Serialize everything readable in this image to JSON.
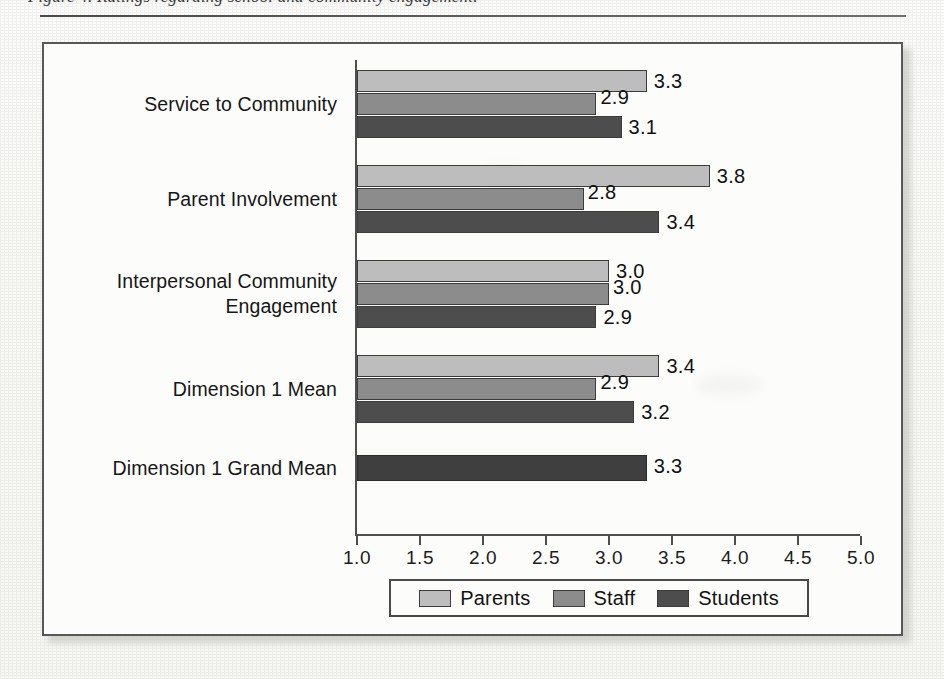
{
  "page": {
    "caption_partial": "Figure 4. Ratings regarding school and community engagement.",
    "background_color": "#fdfdfb"
  },
  "colors": {
    "parents": "#bdbdbd",
    "staff": "#8c8c8c",
    "students": "#4d4d4d",
    "grand_mean": "#3f3f3f",
    "axis": "#4f4f4f",
    "frame": "#585858",
    "text": "#111111"
  },
  "legend": {
    "position": "bottom-center",
    "items": [
      {
        "label": "Parents",
        "color": "#bdbdbd"
      },
      {
        "label": "Staff",
        "color": "#8c8c8c"
      },
      {
        "label": "Students",
        "color": "#4d4d4d"
      }
    ]
  },
  "axis": {
    "tick_labels": [
      "1.0",
      "1.5",
      "2.0",
      "2.5",
      "3.0",
      "3.5",
      "4.0",
      "4.5",
      "5.0"
    ]
  },
  "categories": [
    {
      "label": "Service to Community"
    },
    {
      "label": "Parent Involvement"
    },
    {
      "label": "Interpersonal Community\nEngagement"
    },
    {
      "label": "Dimension 1 Mean"
    },
    {
      "label": "Dimension 1 Grand Mean"
    }
  ],
  "bars": [
    {
      "category": 0,
      "series": "Parents",
      "value": "3.3"
    },
    {
      "category": 0,
      "series": "Staff",
      "value": "2.9"
    },
    {
      "category": 0,
      "series": "Students",
      "value": "3.1"
    },
    {
      "category": 1,
      "series": "Parents",
      "value": "3.8"
    },
    {
      "category": 1,
      "series": "Staff",
      "value": "2.8"
    },
    {
      "category": 1,
      "series": "Students",
      "value": "3.4"
    },
    {
      "category": 2,
      "series": "Parents",
      "value": "3.0"
    },
    {
      "category": 2,
      "series": "Staff",
      "value": "3.0"
    },
    {
      "category": 2,
      "series": "Students",
      "value": "2.9"
    },
    {
      "category": 3,
      "series": "Parents",
      "value": "3.4"
    },
    {
      "category": 3,
      "series": "Staff",
      "value": "2.9"
    },
    {
      "category": 3,
      "series": "Students",
      "value": "3.2"
    },
    {
      "category": 4,
      "series": "Grand Mean",
      "value": "3.3"
    }
  ],
  "chart_data": {
    "type": "bar",
    "orientation": "horizontal",
    "title": "",
    "xlabel": "",
    "ylabel": "",
    "xlim": [
      1.0,
      5.0
    ],
    "xticks": [
      1.0,
      1.5,
      2.0,
      2.5,
      3.0,
      3.5,
      4.0,
      4.5,
      5.0
    ],
    "grid": false,
    "legend_position": "bottom-center",
    "categories": [
      "Service to Community",
      "Parent Involvement",
      "Interpersonal Community Engagement",
      "Dimension 1 Mean",
      "Dimension 1 Grand Mean"
    ],
    "series": [
      {
        "name": "Parents",
        "values": [
          3.3,
          3.8,
          3.0,
          3.4,
          null
        ]
      },
      {
        "name": "Staff",
        "values": [
          2.9,
          2.8,
          3.0,
          2.9,
          null
        ]
      },
      {
        "name": "Students",
        "values": [
          3.1,
          3.4,
          2.9,
          3.2,
          null
        ]
      },
      {
        "name": "Grand Mean",
        "values": [
          null,
          null,
          null,
          null,
          3.3
        ]
      }
    ],
    "data_labels": [
      [
        "3.3",
        "2.9",
        "3.1"
      ],
      [
        "3.8",
        "2.8",
        "3.4"
      ],
      [
        "3.0",
        "3.0",
        "2.9"
      ],
      [
        "3.4",
        "2.9",
        "3.2"
      ],
      [
        "3.3"
      ]
    ]
  }
}
